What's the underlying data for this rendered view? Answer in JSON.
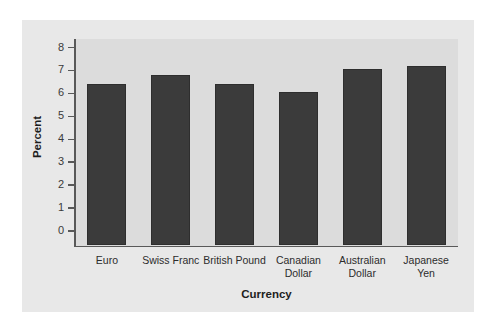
{
  "chart_data": {
    "type": "bar",
    "title": "",
    "xlabel": "Currency",
    "ylabel": "Percent",
    "categories": [
      "Euro",
      "Swiss Franc",
      "British Pound",
      "Canadian\nDollar",
      "Australian\nDollar",
      "Japanese\nYen"
    ],
    "values": [
      6.4,
      6.8,
      6.4,
      6.05,
      7.05,
      7.2
    ],
    "ylim": [
      0,
      8
    ],
    "yticks": [
      0,
      1,
      2,
      3,
      4,
      5,
      6,
      7,
      8
    ],
    "ytick_labels": [
      "0",
      "1",
      "2",
      "3",
      "4",
      "5",
      "6",
      "7",
      "8"
    ],
    "grid": false,
    "legend": null,
    "bar_color": "#3b3b3b",
    "plot_bg_color": "#dcdcdc",
    "panel_bg_color": "#e8e8e8",
    "axis_color": "#595959"
  }
}
